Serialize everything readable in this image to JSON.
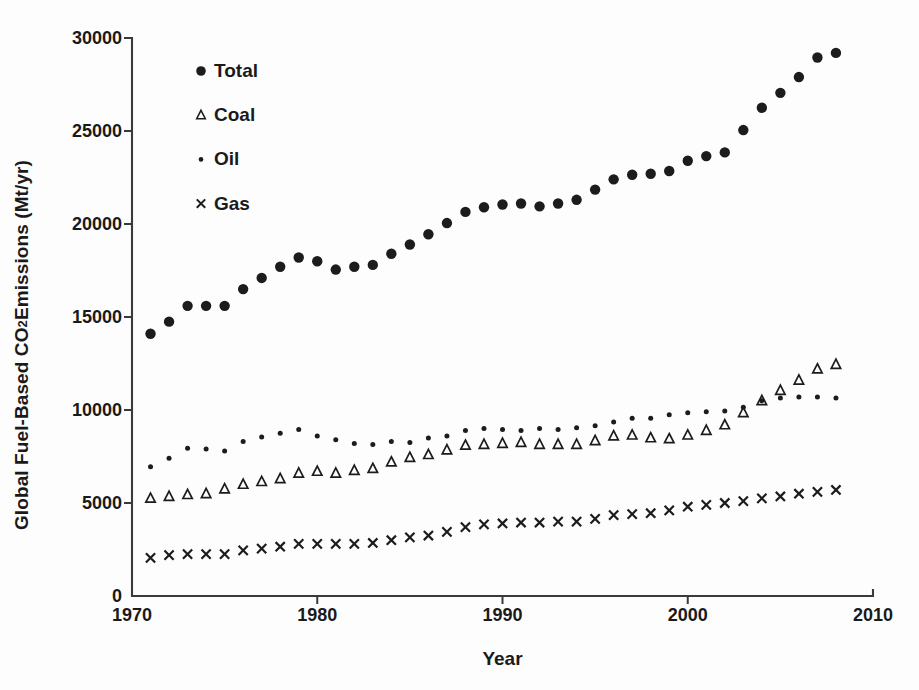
{
  "chart_data": {
    "type": "scatter",
    "title": "",
    "xlabel": "Year",
    "ylabel_text": "Global Fuel-Based CO2 Emissions (Mt/yr)",
    "ylabel_prefix": "Global Fuel-Based CO",
    "ylabel_sub": "2",
    "ylabel_suffix": " Emissions (Mt/yr)",
    "xlim": [
      1970,
      2010
    ],
    "ylim": [
      0,
      30000
    ],
    "xticks": [
      1970,
      1980,
      1990,
      2000,
      2010
    ],
    "xtick_labels": [
      "1970",
      "1980",
      "1990",
      "2000",
      "2010"
    ],
    "yticks": [
      0,
      5000,
      10000,
      15000,
      20000,
      25000,
      30000
    ],
    "ytick_labels": [
      "0",
      "5000",
      "10000",
      "15000",
      "20000",
      "25000",
      "30000"
    ],
    "grid": false,
    "legend_position": "upper-left-inside",
    "marker_color": "#1c1c1c",
    "axis_color": "#3a3a3a",
    "x": [
      1971,
      1972,
      1973,
      1974,
      1975,
      1976,
      1977,
      1978,
      1979,
      1980,
      1981,
      1982,
      1983,
      1984,
      1985,
      1986,
      1987,
      1988,
      1989,
      1990,
      1991,
      1992,
      1993,
      1994,
      1995,
      1996,
      1997,
      1998,
      1999,
      2000,
      2001,
      2002,
      2003,
      2004,
      2005,
      2006,
      2007,
      2008
    ],
    "series": [
      {
        "name": "Total",
        "marker": "filled-circle",
        "values": [
          14100,
          14750,
          15600,
          15600,
          15600,
          16500,
          17100,
          17700,
          18200,
          18000,
          17550,
          17700,
          17800,
          18400,
          18900,
          19450,
          20050,
          20650,
          20900,
          21050,
          21100,
          20950,
          21100,
          21300,
          21850,
          22400,
          22650,
          22700,
          22850,
          23400,
          23650,
          23850,
          25050,
          26250,
          27050,
          27900,
          28950,
          29200
        ]
      },
      {
        "name": "Coal",
        "marker": "open-triangle",
        "values": [
          5250,
          5350,
          5450,
          5500,
          5750,
          6000,
          6150,
          6300,
          6600,
          6700,
          6600,
          6750,
          6850,
          7200,
          7450,
          7600,
          7850,
          8100,
          8150,
          8200,
          8250,
          8150,
          8150,
          8150,
          8350,
          8600,
          8650,
          8500,
          8450,
          8650,
          8900,
          9200,
          9850,
          10500,
          11050,
          11600,
          12200,
          12450
        ]
      },
      {
        "name": "Oil",
        "marker": "small-dot",
        "values": [
          6950,
          7400,
          7950,
          7900,
          7800,
          8300,
          8550,
          8750,
          8950,
          8600,
          8400,
          8200,
          8150,
          8300,
          8250,
          8500,
          8600,
          8900,
          9000,
          8950,
          8900,
          9000,
          8950,
          9050,
          9150,
          9350,
          9550,
          9550,
          9750,
          9850,
          9900,
          9950,
          10150,
          10500,
          10650,
          10700,
          10700,
          10650
        ]
      },
      {
        "name": "Gas",
        "marker": "x-cross",
        "values": [
          2050,
          2200,
          2250,
          2250,
          2250,
          2450,
          2550,
          2650,
          2800,
          2800,
          2800,
          2800,
          2850,
          3000,
          3150,
          3250,
          3450,
          3700,
          3850,
          3900,
          3950,
          3950,
          4000,
          4000,
          4150,
          4350,
          4400,
          4450,
          4600,
          4800,
          4900,
          5000,
          5100,
          5250,
          5350,
          5500,
          5600,
          5700
        ]
      }
    ],
    "legend": [
      {
        "label": "Total",
        "marker": "filled-circle"
      },
      {
        "label": "Coal",
        "marker": "open-triangle"
      },
      {
        "label": "Oil",
        "marker": "small-dot"
      },
      {
        "label": "Gas",
        "marker": "x-cross"
      }
    ]
  }
}
